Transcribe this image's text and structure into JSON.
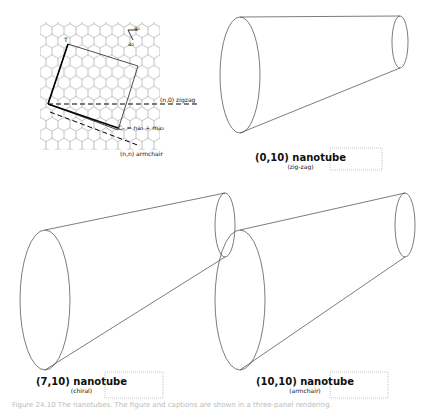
{
  "lattice_panel": {
    "vector_T": "T",
    "vector_a1": "a₁",
    "vector_a2": "a₂",
    "chiral_vector": "Cₕ = na₁ + ma₂",
    "zigzag_label": "(n,0) zigzag",
    "armchair_label": "(n,n) armchair"
  },
  "tubes": [
    {
      "title": "(0,10) nanotube",
      "subtitle": "(zig-zag)"
    },
    {
      "title": "(7,10) nanotube",
      "subtitle": "(chiral)"
    },
    {
      "title": "(10,10) nanotube",
      "subtitle": "(armchair)"
    }
  ],
  "caption": "Figure 24.10 The nanotubes. The figure and captions are shown in a three-panel rendering."
}
